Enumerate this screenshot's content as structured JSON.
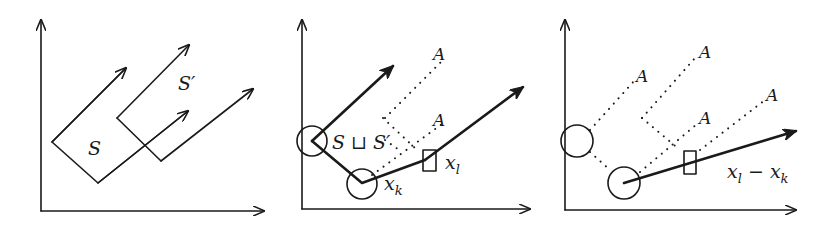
{
  "figure": {
    "panels": [
      {
        "id": "panel-1",
        "labels": {
          "set_s": "S",
          "set_s_prime": "S′"
        }
      },
      {
        "id": "panel-2",
        "labels": {
          "union": "S ⊔ S′",
          "x_k": "x",
          "x_k_sub": "k",
          "x_l": "x",
          "x_l_sub": "l",
          "a1": "A",
          "a2": "A"
        }
      },
      {
        "id": "panel-3",
        "labels": {
          "diff_x1": "x",
          "diff_sub1": "l",
          "diff_minus": " − ",
          "diff_x2": "x",
          "diff_sub2": "k",
          "a1": "A",
          "a2": "A",
          "a3": "A",
          "a4": "A"
        }
      }
    ],
    "colors": {
      "ink": "#1a1a1a",
      "background": "#ffffff"
    }
  }
}
